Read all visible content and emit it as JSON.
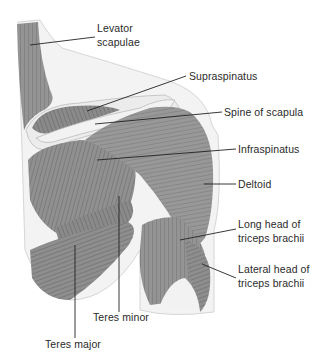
{
  "figure": {
    "colors": {
      "background": "#ffffff",
      "muscle_dark": "#6e6e6e",
      "muscle_mid": "#8c8c8c",
      "muscle_light": "#a8a8a8",
      "bone": "#ececec",
      "skin_outline": "#d8d8d8",
      "leader_line": "#222222",
      "text": "#2a2a2a"
    },
    "labels": [
      {
        "id": "levator-scapulae",
        "line1": "Levator",
        "line2": "scapulae"
      },
      {
        "id": "supraspinatus",
        "line1": "Supraspinatus"
      },
      {
        "id": "spine-of-scapula",
        "line1": "Spine of scapula"
      },
      {
        "id": "infraspinatus",
        "line1": "Infraspinatus"
      },
      {
        "id": "deltoid",
        "line1": "Deltoid"
      },
      {
        "id": "long-head-triceps",
        "line1": "Long head of",
        "line2": "triceps brachii"
      },
      {
        "id": "lateral-head-triceps",
        "line1": "Lateral head of",
        "line2": "triceps brachii"
      },
      {
        "id": "teres-minor",
        "line1": "Teres minor"
      },
      {
        "id": "teres-major",
        "line1": "Teres major"
      }
    ]
  }
}
